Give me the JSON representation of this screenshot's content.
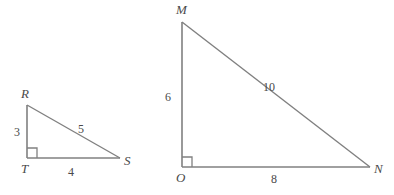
{
  "figure": {
    "background_color": "#ffffff",
    "stroke_color": "#808080",
    "label_color": "#4a4a4a"
  },
  "triangles": [
    {
      "name": "triangle-RTS",
      "vertices": [
        {
          "label": "R",
          "x": 27,
          "y": 105,
          "label_x": 21,
          "label_y": 87
        },
        {
          "label": "T",
          "x": 27,
          "y": 158,
          "label_x": 21,
          "label_y": 162
        },
        {
          "label": "S",
          "x": 120,
          "y": 158,
          "label_x": 124,
          "label_y": 154
        }
      ],
      "sides": [
        {
          "name": "leg-RT",
          "label": "3",
          "label_x": 14,
          "label_y": 126
        },
        {
          "name": "leg-TS",
          "label": "4",
          "label_x": 68,
          "label_y": 166
        },
        {
          "name": "hypotenuse-RS",
          "label": "5",
          "label_x": 78,
          "label_y": 123
        }
      ],
      "right_angle_at": "T"
    },
    {
      "name": "triangle-MON",
      "vertices": [
        {
          "label": "M",
          "x": 182,
          "y": 22,
          "label_x": 176,
          "label_y": 3
        },
        {
          "label": "O",
          "x": 182,
          "y": 167,
          "label_x": 176,
          "label_y": 171
        },
        {
          "label": "N",
          "x": 370,
          "y": 167,
          "label_x": 374,
          "label_y": 162
        }
      ],
      "sides": [
        {
          "name": "leg-MO",
          "label": "6",
          "label_x": 165,
          "label_y": 91
        },
        {
          "name": "leg-ON",
          "label": "8",
          "label_x": 271,
          "label_y": 173
        },
        {
          "name": "hypotenuse-MN",
          "label": "10",
          "label_x": 263,
          "label_y": 81
        }
      ],
      "right_angle_at": "O"
    }
  ]
}
